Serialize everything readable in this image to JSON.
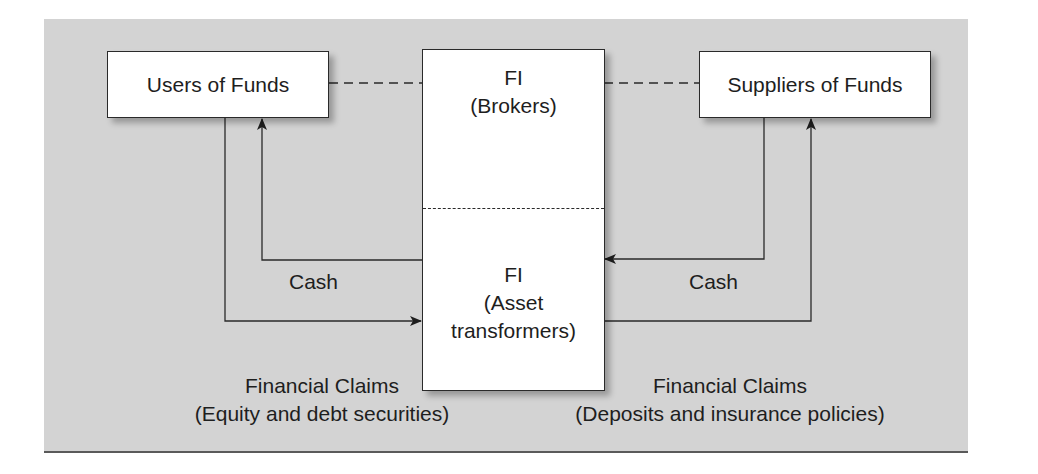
{
  "diagram": {
    "nodes": {
      "users": {
        "label": "Users of Funds"
      },
      "suppliers": {
        "label": "Suppliers of Funds"
      },
      "fi_brokers": {
        "title": "FI",
        "subtitle": "(Brokers)"
      },
      "fi_asset": {
        "title": "FI",
        "subtitle_line1": "(Asset",
        "subtitle_line2": "transformers)"
      }
    },
    "flows": {
      "cash_left": "Cash",
      "cash_right": "Cash"
    },
    "captions": {
      "left": {
        "line1": "Financial Claims",
        "line2": "(Equity and debt securities)"
      },
      "right": {
        "line1": "Financial Claims",
        "line2": "(Deposits and insurance policies)"
      }
    },
    "colors": {
      "panel_background": "#d3d3d3",
      "box_fill": "#ffffff",
      "line": "#2a2a2a"
    }
  }
}
